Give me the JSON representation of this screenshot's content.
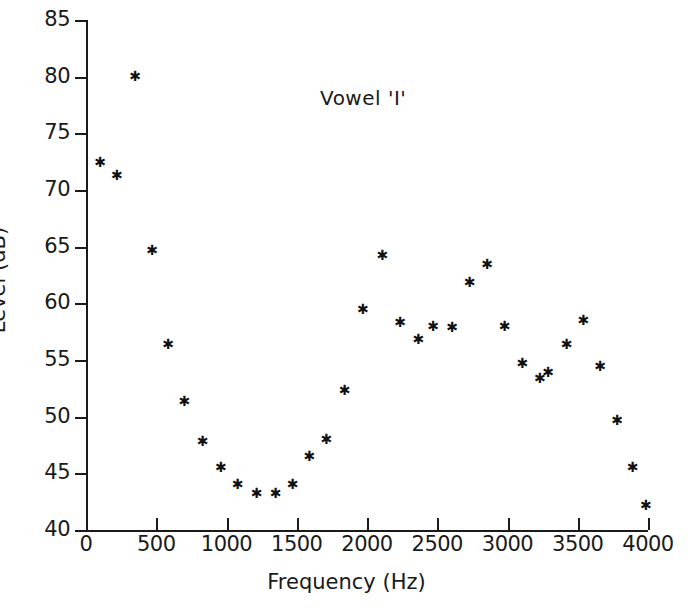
{
  "chart_data": {
    "type": "scatter",
    "title": "Vowel 'I'",
    "xlabel": "Frequency (Hz)",
    "ylabel": "Level (dB)",
    "xlim": [
      0,
      4000
    ],
    "ylim": [
      40,
      85
    ],
    "xticks": [
      0,
      500,
      1000,
      1500,
      2000,
      2500,
      3000,
      3500,
      4000
    ],
    "xtick_labels": [
      "0",
      "500",
      "1000",
      "1500",
      "2000",
      "2500",
      "3000",
      "3500",
      "4000"
    ],
    "yticks": [
      40,
      45,
      50,
      55,
      60,
      65,
      70,
      75,
      80,
      85
    ],
    "ytick_labels": [
      "40",
      "45",
      "50",
      "55",
      "60",
      "65",
      "70",
      "75",
      "80",
      "85"
    ],
    "grid": false,
    "legend": "none",
    "marker": "asterisk",
    "marker_color": "#111111",
    "x": [
      100,
      220,
      350,
      470,
      585,
      700,
      830,
      960,
      1080,
      1215,
      1350,
      1470,
      1590,
      1710,
      1840,
      1970,
      2110,
      2235,
      2365,
      2470,
      2605,
      2730,
      2855,
      2980,
      3105,
      3230,
      3365,
      3490,
      3610,
      3745,
      3870,
      3985
    ],
    "y": [
      72.4,
      71.3,
      80.0,
      64.7,
      56.4,
      51.3,
      47.8,
      45.5,
      44.0,
      43.2,
      43.2,
      44.0,
      46.5,
      48.0,
      52.3,
      59.5,
      64.2,
      58.3,
      56.8,
      58.0,
      57.9,
      61.8,
      63.4,
      58.0,
      54.7,
      53.4,
      53.9,
      56.4,
      58.5,
      54.4,
      49.7,
      45.5,
      42.2
    ],
    "points": [
      {
        "x": 100,
        "y": 72.4
      },
      {
        "x": 220,
        "y": 71.3
      },
      {
        "x": 350,
        "y": 80.0
      },
      {
        "x": 470,
        "y": 64.7
      },
      {
        "x": 585,
        "y": 56.4
      },
      {
        "x": 700,
        "y": 51.3
      },
      {
        "x": 830,
        "y": 47.8
      },
      {
        "x": 960,
        "y": 45.5
      },
      {
        "x": 1080,
        "y": 44.0
      },
      {
        "x": 1215,
        "y": 43.2
      },
      {
        "x": 1350,
        "y": 43.2
      },
      {
        "x": 1470,
        "y": 44.0
      },
      {
        "x": 1590,
        "y": 46.5
      },
      {
        "x": 1710,
        "y": 48.0
      },
      {
        "x": 1840,
        "y": 52.3
      },
      {
        "x": 1970,
        "y": 59.5
      },
      {
        "x": 2110,
        "y": 64.2
      },
      {
        "x": 2235,
        "y": 58.3
      },
      {
        "x": 2365,
        "y": 56.8
      },
      {
        "x": 2470,
        "y": 58.0
      },
      {
        "x": 2605,
        "y": 57.9
      },
      {
        "x": 2730,
        "y": 61.8
      },
      {
        "x": 2855,
        "y": 63.4
      },
      {
        "x": 2980,
        "y": 58.0
      },
      {
        "x": 3105,
        "y": 54.7
      },
      {
        "x": 3230,
        "y": 53.4
      },
      {
        "x": 3290,
        "y": 53.9
      },
      {
        "x": 3420,
        "y": 56.4
      },
      {
        "x": 3540,
        "y": 58.5
      },
      {
        "x": 3660,
        "y": 54.4
      },
      {
        "x": 3780,
        "y": 49.7
      },
      {
        "x": 3890,
        "y": 45.5
      },
      {
        "x": 3985,
        "y": 42.2
      }
    ]
  }
}
